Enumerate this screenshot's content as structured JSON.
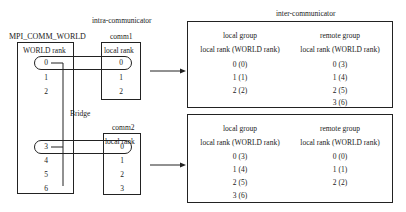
{
  "world": {
    "title": "MPI_COMM_WORLD",
    "header": "WORLD rank",
    "ranks": [
      "0",
      "1",
      "2",
      "3",
      "4",
      "5",
      "6"
    ]
  },
  "intra": {
    "title": "intra-communicator",
    "comm1": {
      "title": "comm1",
      "header": "local rank",
      "ranks": [
        "0",
        "1",
        "2"
      ]
    },
    "comm2": {
      "title": "comm2",
      "header": "local rank",
      "ranks": [
        "0",
        "1",
        "2",
        "3"
      ]
    }
  },
  "bridge": {
    "label": "Bridge"
  },
  "inter": {
    "title": "inter-communicator",
    "top": {
      "local": {
        "title": "local group",
        "header": "local rank (WORLD rank)",
        "rows": [
          "0 (0)",
          "1 (1)",
          "2 (2)"
        ]
      },
      "remote": {
        "title": "remote group",
        "header": "local rank (WORLD rank)",
        "rows": [
          "0 (3)",
          "1 (4)",
          "2 (5)",
          "3 (6)"
        ]
      }
    },
    "bottom": {
      "local": {
        "title": "local group",
        "header": "local rank (WORLD rank)",
        "rows": [
          "0 (3)",
          "1 (4)",
          "2 (5)",
          "3 (6)"
        ]
      },
      "remote": {
        "title": "remote group",
        "header": "local rank (WORLD rank)",
        "rows": [
          "0 (0)",
          "1 (1)",
          "2 (2)"
        ]
      }
    }
  }
}
